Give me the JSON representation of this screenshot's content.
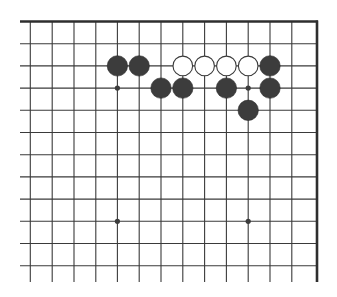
{
  "diagram": {
    "type": "go-board-fragment",
    "colors": {
      "background": "#ffffff",
      "line": "#3a3a3a",
      "edge": "#2e2e2e",
      "black_stone": "#3c3c3c",
      "white_stone": "#ffffff",
      "white_stone_outline": "#3a3a3a",
      "star_point": "#3c3c3c"
    },
    "grid": {
      "columns_x": [
        30.3,
        52.2,
        74.0,
        95.8,
        117.4,
        139.2,
        161.0,
        182.8,
        204.6,
        226.4,
        248.2,
        270.0,
        291.8
      ],
      "rows_y": [
        21.5,
        43.7,
        65.9,
        88.1,
        110.3,
        132.5,
        154.7,
        176.9,
        199.1,
        221.3,
        243.5,
        265.7
      ],
      "left_extent": 20,
      "right_edge_x": 317,
      "top_edge_y": 21.5,
      "bottom_extent": 282,
      "top_edge_is_board_edge": true,
      "right_edge_is_board_edge": true
    },
    "stone_radius": 10.2,
    "star_points": [
      {
        "col": 4,
        "row": 3
      },
      {
        "col": 10,
        "row": 3
      },
      {
        "col": 4,
        "row": 9
      },
      {
        "col": 10,
        "row": 9
      }
    ],
    "stones": [
      {
        "color": "black",
        "col": 4,
        "row": 2
      },
      {
        "color": "black",
        "col": 5,
        "row": 2
      },
      {
        "color": "white",
        "col": 7,
        "row": 2
      },
      {
        "color": "white",
        "col": 8,
        "row": 2
      },
      {
        "color": "white",
        "col": 9,
        "row": 2
      },
      {
        "color": "white",
        "col": 10,
        "row": 2
      },
      {
        "color": "black",
        "col": 11,
        "row": 2
      },
      {
        "color": "black",
        "col": 6,
        "row": 3
      },
      {
        "color": "black",
        "col": 7,
        "row": 3
      },
      {
        "color": "black",
        "col": 9,
        "row": 3
      },
      {
        "color": "black",
        "col": 11,
        "row": 3
      },
      {
        "color": "black",
        "col": 10,
        "row": 4
      }
    ]
  }
}
